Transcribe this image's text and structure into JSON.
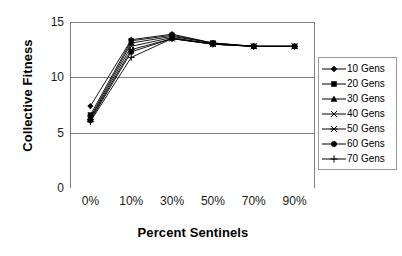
{
  "chart_data": {
    "type": "line",
    "title": "",
    "xlabel": "Percent Sentinels",
    "ylabel": "Collective Fitness",
    "categories": [
      "0%",
      "10%",
      "30%",
      "50%",
      "70%",
      "90%"
    ],
    "ylim": [
      0,
      15
    ],
    "yticks": [
      0,
      5,
      10,
      15
    ],
    "ytick_labels": [
      "0",
      "5",
      "10",
      "15"
    ],
    "grid": "horizontal",
    "legend_position": "right",
    "series": [
      {
        "name": "10 Gens",
        "marker": "diamond",
        "values": [
          7.4,
          13.4,
          13.9,
          13.1,
          12.8,
          12.8
        ]
      },
      {
        "name": "20 Gens",
        "marker": "square",
        "values": [
          6.6,
          13.3,
          13.8,
          13.1,
          12.8,
          12.8
        ]
      },
      {
        "name": "30 Gens",
        "marker": "triangle",
        "values": [
          6.4,
          13.1,
          13.7,
          13.1,
          12.8,
          12.8
        ]
      },
      {
        "name": "40 Gens",
        "marker": "x",
        "values": [
          6.3,
          12.8,
          13.6,
          13.0,
          12.8,
          12.8
        ]
      },
      {
        "name": "50 Gens",
        "marker": "asterisk",
        "values": [
          6.2,
          12.5,
          13.5,
          13.0,
          12.8,
          12.8
        ]
      },
      {
        "name": "60 Gens",
        "marker": "circle",
        "values": [
          6.1,
          12.3,
          13.5,
          13.0,
          12.8,
          12.8
        ]
      },
      {
        "name": "70 Gens",
        "marker": "plus",
        "values": [
          6.0,
          11.8,
          13.5,
          13.0,
          12.8,
          12.8
        ]
      }
    ],
    "colors": {
      "axis": "#808080",
      "grid": "#808080",
      "series": "#000000",
      "background": "#ffffff"
    }
  },
  "legend": {
    "entries": [
      {
        "label": "10 Gens"
      },
      {
        "label": "20 Gens"
      },
      {
        "label": "30 Gens"
      },
      {
        "label": "40 Gens"
      },
      {
        "label": "50 Gens"
      },
      {
        "label": "60 Gens"
      },
      {
        "label": "70 Gens"
      }
    ]
  }
}
